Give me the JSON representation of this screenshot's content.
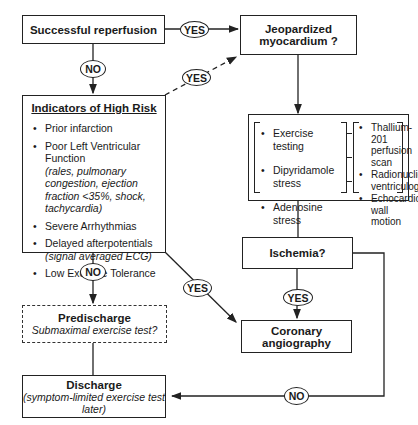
{
  "nodes": {
    "reperfusion": {
      "label": "Successful reperfusion"
    },
    "jeopardized": {
      "line1": "Jeopardized",
      "line2": "myocardium ?"
    },
    "high_risk": {
      "title": "Indicators of High Risk",
      "items": [
        {
          "label": "Prior infarction",
          "detail": ""
        },
        {
          "label": "Poor Left Ventricular Function",
          "detail": "(rales, pulmonary congestion, ejection fraction <35%, shock, tachycardia)"
        },
        {
          "label": "Severe Arrhythmias",
          "detail": ""
        },
        {
          "label": "Delayed afterpotentials",
          "detail": "(signal averaged ECG)"
        },
        {
          "label": "Low Exercise Tolerance",
          "detail": ""
        }
      ]
    },
    "tests": {
      "stress_methods": [
        "Exercise testing",
        "Dipyridamole stress",
        "Adenosine stress"
      ],
      "imaging_methods": [
        {
          "line1": "Thallium-201",
          "line2": "perfusion scan"
        },
        {
          "line1": "Radionuclide",
          "line2": "ventriculography"
        },
        {
          "line1": "Echocardiographic",
          "line2": "wall motion"
        }
      ]
    },
    "ischemia": {
      "label": "Ischemia?"
    },
    "angiography": {
      "label": "Coronary angiography"
    },
    "predischarge": {
      "title": "Predischarge",
      "subtitle": "Submaximal exercise test?"
    },
    "discharge": {
      "title": "Discharge",
      "subtitle": "(symptom-limited exercise test later)"
    }
  },
  "edges": {
    "reperfusion_to_jeopardized": "YES",
    "reperfusion_to_highrisk": "NO",
    "highrisk_to_jeopardized": "YES",
    "highrisk_to_predischarge": "NO",
    "highrisk_to_angiography": "YES",
    "ischemia_to_angiography": "YES",
    "ischemia_to_discharge": "NO"
  }
}
